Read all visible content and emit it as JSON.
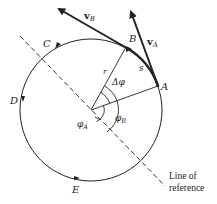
{
  "diagram": {
    "points": [
      {
        "id": "A",
        "label": "A"
      },
      {
        "id": "B",
        "label": "B"
      },
      {
        "id": "C",
        "label": "C"
      },
      {
        "id": "D",
        "label": "D"
      },
      {
        "id": "E",
        "label": "E"
      }
    ],
    "vectors": [
      {
        "id": "vA",
        "base": "v",
        "sub": "A"
      },
      {
        "id": "vB",
        "base": "v",
        "sub": "B"
      }
    ],
    "radius_label": "r",
    "arc_length_label": "s",
    "angles": {
      "delta_phi": "Δφ",
      "phi_A": {
        "base": "φ",
        "sub": "A"
      },
      "phi_B": {
        "base": "φ",
        "sub": "B"
      }
    },
    "reference_line": {
      "line1": "Line of",
      "line2": "reference"
    },
    "colors": {
      "ink": "#222222",
      "background": "#ffffff"
    }
  }
}
